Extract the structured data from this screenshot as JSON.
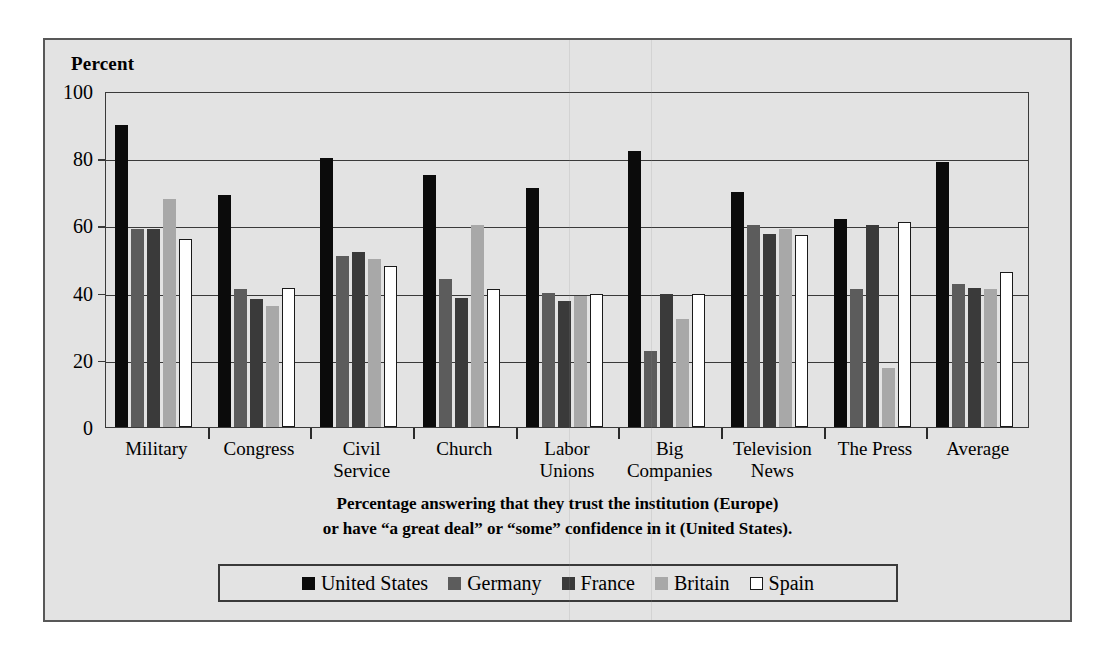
{
  "figure": {
    "y_axis_title": "Percent",
    "caption_line1": "Percentage answering that they trust the institution (Europe)",
    "caption_line2": "or have “a great deal” or “some” confidence in it (United States)."
  },
  "colors": {
    "united_states": "#0b0b0b",
    "germany": "#5c5c5c",
    "france": "#3a3a3a",
    "britain": "#a8a8a8",
    "spain": "#ffffff",
    "frame": "#585858",
    "panel_background": "#e3e3e3",
    "axis": "#3a3a3a"
  },
  "chart_data": {
    "type": "bar",
    "title": "",
    "subtitle": "",
    "xlabel": "",
    "ylabel": "Percent",
    "ylim": [
      0,
      100
    ],
    "yticks": [
      0,
      20,
      40,
      60,
      80,
      100
    ],
    "ytick_labels": [
      "0",
      "20",
      "40",
      "60",
      "80",
      "100"
    ],
    "grid": true,
    "legend_position": "bottom",
    "categories": [
      "Military",
      "Congress",
      "Civil\nService",
      "Church",
      "Labor\nUnions",
      "Big\nCompanies",
      "Television\nNews",
      "The Press",
      "Average"
    ],
    "series": [
      {
        "name": "United States",
        "color": "#0b0b0b",
        "values": [
          90,
          69,
          80,
          75,
          71,
          82,
          70,
          62,
          79
        ]
      },
      {
        "name": "Germany",
        "color": "#5c5c5c",
        "values": [
          59,
          41,
          51,
          44,
          40,
          22.5,
          60,
          41,
          42.5
        ]
      },
      {
        "name": "France",
        "color": "#3a3a3a",
        "values": [
          59,
          38,
          52,
          38.5,
          37.5,
          39.5,
          57.5,
          60,
          41.5
        ]
      },
      {
        "name": "Britain",
        "color": "#a8a8a8",
        "values": [
          68,
          36,
          50,
          60,
          39,
          32,
          59,
          17.5,
          41
        ]
      },
      {
        "name": "Spain",
        "color": "#ffffff",
        "values": [
          56,
          41.5,
          48,
          41,
          39.5,
          39.5,
          57,
          61,
          46
        ]
      }
    ]
  },
  "legend": {
    "items": [
      {
        "label": "United States",
        "key": "us"
      },
      {
        "label": "Germany",
        "key": "germany"
      },
      {
        "label": "France",
        "key": "france"
      },
      {
        "label": "Britain",
        "key": "britain"
      },
      {
        "label": "Spain",
        "key": "spain"
      }
    ]
  }
}
